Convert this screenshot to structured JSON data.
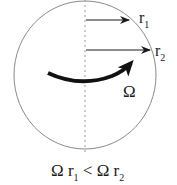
{
  "diagram": {
    "type": "rotating-disk",
    "labels": {
      "r1_main": "r",
      "r1_sub": "1",
      "r2_main": "r",
      "r2_sub": "2",
      "omega": "Ω"
    },
    "caption": {
      "part1": "Ω r",
      "sub1": "1",
      "part2": " < Ω r",
      "sub2": "2"
    },
    "colors": {
      "circle": "#8a8a8a",
      "arrow": "#1a1a1a",
      "axis": "#9a9a9a"
    }
  }
}
